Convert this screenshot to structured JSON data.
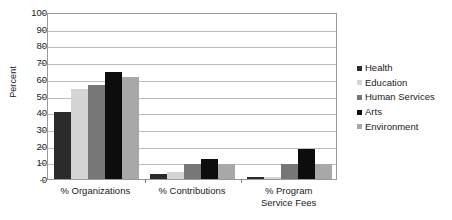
{
  "chart_data": {
    "type": "bar",
    "title": "",
    "xlabel": "",
    "ylabel": "Percent",
    "ylim": [
      0,
      100
    ],
    "ytick_step": 10,
    "grid": true,
    "legend_position": "right",
    "categories": [
      "% Organizations",
      "% Contributions",
      "% Program\nService Fees"
    ],
    "ytick_labels": [
      "100",
      "90",
      "80",
      "70",
      "60",
      "50",
      "40",
      "30",
      "20",
      "10",
      "0"
    ],
    "series": [
      {
        "name": "Health",
        "color": "#2b2b2b",
        "values": [
          40,
          3,
          1
        ]
      },
      {
        "name": "Education",
        "color": "#d4d4d4",
        "values": [
          54,
          4,
          1
        ]
      },
      {
        "name": "Human Services",
        "color": "#777777",
        "values": [
          56,
          9,
          9
        ]
      },
      {
        "name": "Arts",
        "color": "#0d0d0d",
        "values": [
          64,
          12,
          18
        ]
      },
      {
        "name": "Environment",
        "color": "#a8a8a8",
        "values": [
          61,
          9,
          9
        ]
      }
    ]
  }
}
